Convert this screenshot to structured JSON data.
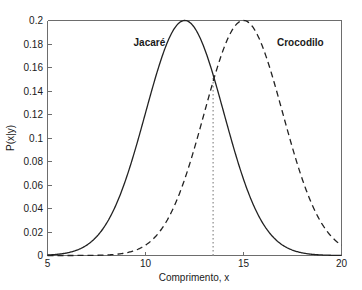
{
  "chart_data": {
    "type": "line",
    "title": "",
    "xlabel": "Comprimento, x",
    "ylabel": "P(x|y)",
    "xlim": [
      5,
      20
    ],
    "ylim": [
      0,
      0.2
    ],
    "xticks": [
      "5",
      "10",
      "15",
      "20"
    ],
    "xtick_values": [
      5,
      10,
      15,
      20
    ],
    "yticks": [
      "0",
      "0.02",
      "0.04",
      "0.06",
      "0.08",
      "0.1",
      "0.12",
      "0.14",
      "0.16",
      "0.18",
      "0.2"
    ],
    "ytick_values": [
      0,
      0.02,
      0.04,
      0.06,
      0.08,
      0.1,
      0.12,
      0.14,
      0.16,
      0.18,
      0.2
    ],
    "grid": false,
    "legend_position": "inline-annotations",
    "series": [
      {
        "name": "Jacaré",
        "style": "solid",
        "color": "#222222",
        "distribution": "normal",
        "mean": 12,
        "sigma": 2,
        "peak": 0.2,
        "label_x": 10.2,
        "label_y": 0.178
      },
      {
        "name": "Crocodilo",
        "style": "dashed",
        "color": "#222222",
        "distribution": "normal",
        "mean": 15,
        "sigma": 2,
        "peak": 0.2,
        "label_x": 17.9,
        "label_y": 0.178
      }
    ],
    "annotations": [
      {
        "name": "decision-threshold",
        "type": "vline",
        "style": "dotted",
        "color": "#9a9a9a",
        "x": 13.45,
        "y_from": 0,
        "y_to": 0.152
      }
    ]
  },
  "labels": {
    "series_jacare": "Jacaré",
    "series_crocodilo": "Crocodilo",
    "xaxis": "Comprimento, x",
    "yaxis": "P(x|y)"
  }
}
